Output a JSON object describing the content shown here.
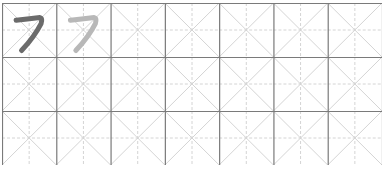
{
  "worksheet": {
    "character": "フ",
    "columns": 7,
    "rows": 3,
    "cells": [
      {
        "row": 0,
        "col": 0,
        "glyph": "フ",
        "style": "dark"
      },
      {
        "row": 0,
        "col": 1,
        "glyph": "フ",
        "style": "trace"
      }
    ],
    "colors": {
      "border": "#7a7a7a",
      "guide": "#d4d4d4",
      "glyph_dark": "#6b6b6b",
      "glyph_trace": "#b8b8b8"
    }
  }
}
